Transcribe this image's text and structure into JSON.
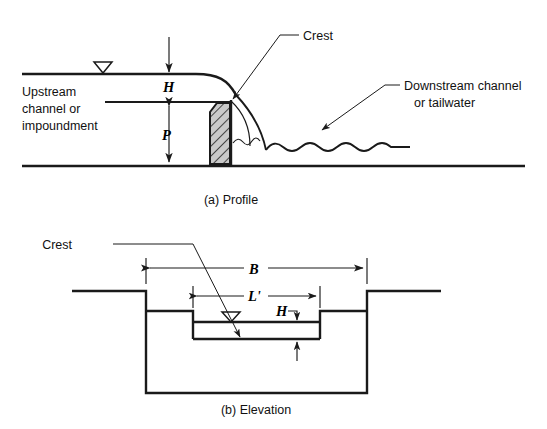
{
  "figure": {
    "line_color": "#1a1a1a",
    "background": "#ffffff"
  },
  "profile": {
    "caption": "(a) Profile",
    "labels": {
      "crest": "Crest",
      "upstream_line1": "Upstream",
      "upstream_line2": "channel or",
      "upstream_line3": "impoundment",
      "downstream_line1": "Downstream channel",
      "downstream_line2": "or tailwater",
      "head_symbol": "H",
      "height_symbol": "P"
    }
  },
  "elevation": {
    "caption": "(b) Elevation",
    "labels": {
      "crest": "Crest",
      "channel_width_symbol": "B",
      "crest_length_symbol": "L'",
      "head_symbol": "H"
    }
  }
}
